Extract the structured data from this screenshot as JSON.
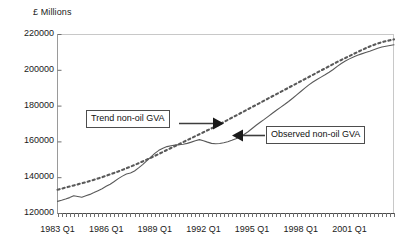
{
  "chart_data": {
    "type": "line",
    "title": "",
    "subtitle": "",
    "ylabel": "£ Millions",
    "xlabel": "",
    "ylim": [
      120000,
      220000
    ],
    "yticks": [
      120000,
      140000,
      160000,
      180000,
      200000,
      220000
    ],
    "ytick_labels": [
      "120000",
      "140000",
      "160000",
      "180000",
      "200000",
      "220000"
    ],
    "xticks": [
      "1983 Q1",
      "1986 Q1",
      "1989 Q1",
      "1992 Q1",
      "1995 Q1",
      "1998 Q1",
      "2001 Q1"
    ],
    "xtick_positions": [
      0,
      12,
      24,
      36,
      48,
      60,
      72
    ],
    "x_minor_tick_count": 84,
    "x_start": "1983 Q1",
    "x_end": "2003 Q4",
    "grid": false,
    "legend": "annotations",
    "series": [
      {
        "name": "Observed non-oil GVA",
        "style": "solid",
        "color": "#595959",
        "values": [
          126500,
          127100,
          127800,
          128600,
          129600,
          129200,
          128800,
          129600,
          130400,
          131400,
          132500,
          133600,
          134900,
          136100,
          137600,
          139200,
          140600,
          141800,
          142300,
          143500,
          145200,
          147000,
          149100,
          151200,
          153300,
          155000,
          156200,
          157100,
          157600,
          157900,
          158200,
          158400,
          158900,
          159600,
          160400,
          161000,
          160400,
          159600,
          158900,
          158700,
          158800,
          159200,
          159800,
          160600,
          161500,
          162600,
          163900,
          165400,
          167200,
          169000,
          170700,
          172300,
          174000,
          175700,
          177400,
          179000,
          180600,
          182300,
          184100,
          186000,
          187900,
          189800,
          191600,
          193200,
          194600,
          195900,
          197200,
          198600,
          200200,
          201900,
          203500,
          204900,
          206100,
          207200,
          208100,
          208900,
          209700,
          210400,
          211200,
          212000,
          212700,
          213200,
          213600,
          214000
        ]
      },
      {
        "name": "Trend non-oil GVA",
        "style": "dotted",
        "color": "#595959",
        "values": [
          133000,
          133600,
          134200,
          134800,
          135400,
          136000,
          136600,
          137200,
          137900,
          138600,
          139300,
          140000,
          140800,
          141600,
          142400,
          143200,
          144100,
          145000,
          145900,
          146800,
          147800,
          148800,
          149800,
          150800,
          151900,
          153000,
          154100,
          155200,
          156300,
          157400,
          158500,
          159600,
          160700,
          161800,
          162900,
          164000,
          165100,
          166200,
          167300,
          168400,
          169600,
          170800,
          172000,
          173200,
          174400,
          175600,
          176800,
          178000,
          179200,
          180400,
          181600,
          182800,
          184000,
          185200,
          186400,
          187600,
          188800,
          190000,
          191200,
          192400,
          193600,
          194800,
          196000,
          197200,
          198400,
          199600,
          200800,
          202000,
          203200,
          204400,
          205500,
          206600,
          207700,
          208800,
          209900,
          211000,
          212000,
          213000,
          213900,
          214700,
          215400,
          216000,
          216500,
          217000
        ]
      }
    ],
    "annotations": [
      {
        "id": "trend",
        "label": "Trend non-oil GVA",
        "arrow": "right",
        "points_to": "Trend non-oil GVA"
      },
      {
        "id": "observed",
        "label": "Observed non-oil GVA",
        "arrow": "left",
        "points_to": "Observed non-oil GVA"
      }
    ]
  }
}
